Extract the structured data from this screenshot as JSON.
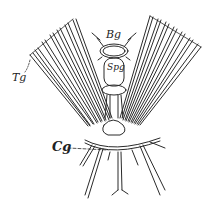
{
  "figure": {
    "labels": {
      "brain": "Bg",
      "subpharyngeal": "Spg",
      "thoracic": "Tg",
      "cerebral": "Cg"
    },
    "colors": {
      "ink": "#2a2a2a",
      "background": "#ffffff"
    }
  }
}
